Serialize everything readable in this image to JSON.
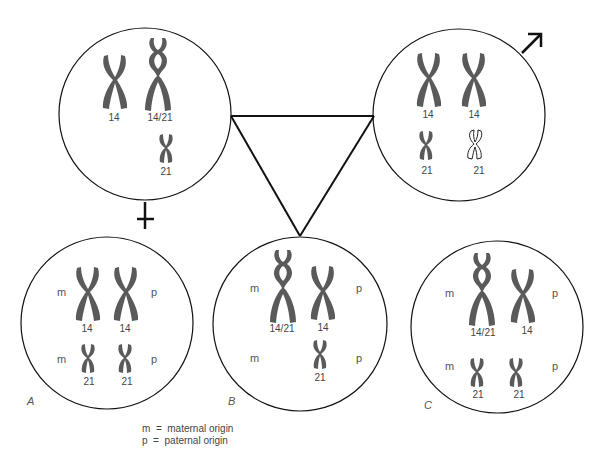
{
  "figure": {
    "colors": {
      "stroke": "#111111",
      "chromosome": "#5a5a5a",
      "text": "#444444",
      "background": "#ffffff"
    },
    "parents": {
      "female": {
        "symbol": "female-symbol",
        "chromosomes": [
          {
            "label": "14",
            "type": "normal-14"
          },
          {
            "label": "14/21",
            "type": "translocation-14-21"
          },
          {
            "label": "21",
            "type": "normal-21"
          }
        ]
      },
      "male": {
        "symbol": "male-symbol",
        "chromosomes": [
          {
            "label": "14",
            "type": "normal-14"
          },
          {
            "label": "14",
            "type": "normal-14"
          },
          {
            "label": "21",
            "type": "normal-21"
          },
          {
            "label": "21",
            "type": "normal-21-outlined"
          }
        ]
      }
    },
    "offspring": [
      {
        "panel": "A",
        "rows": [
          {
            "left": "m",
            "right": "p",
            "chromosomes": [
              "14",
              "14"
            ]
          },
          {
            "left": "m",
            "right": "p",
            "chromosomes": [
              "21",
              "21"
            ]
          }
        ]
      },
      {
        "panel": "B",
        "rows": [
          {
            "left": "m",
            "right": "p",
            "chromosomes": [
              "14/21",
              "14"
            ]
          },
          {
            "left": "m",
            "right": "p",
            "chromosomes": [
              "21"
            ]
          }
        ]
      },
      {
        "panel": "C",
        "rows": [
          {
            "left": "m",
            "right": "p",
            "chromosomes": [
              "14/21",
              "14"
            ]
          },
          {
            "left": "m",
            "right": "p",
            "chromosomes": [
              "21",
              "21"
            ]
          }
        ]
      }
    ],
    "legend": {
      "m": "m  =  maternal origin",
      "p": "p  =  paternal origin"
    }
  }
}
